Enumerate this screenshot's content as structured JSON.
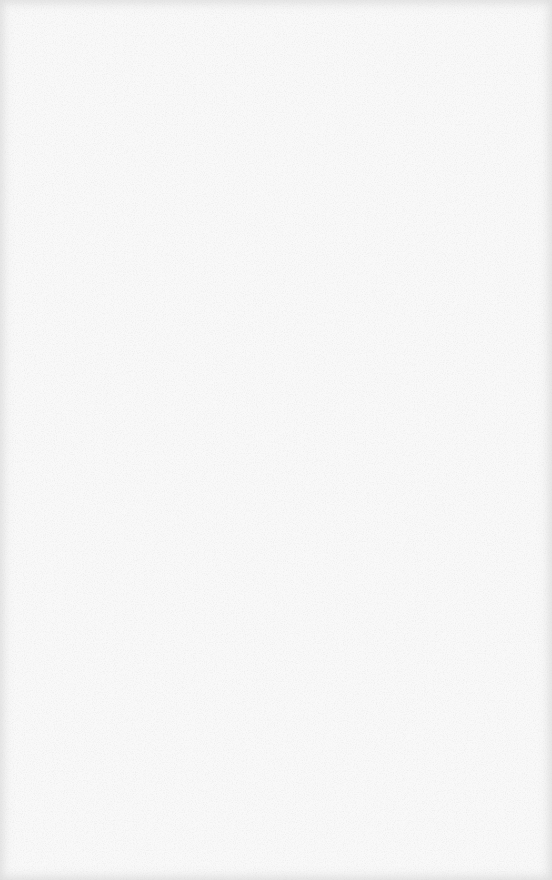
{
  "page": {
    "background_color": "#f9f9f9",
    "grain_color": "#d8d8d8",
    "edge_shade_color": "#e6e6e6"
  }
}
